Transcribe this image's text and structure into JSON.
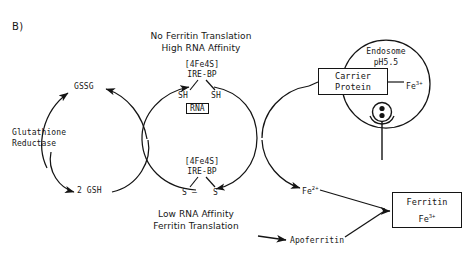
{
  "figure": {
    "panel_label": "B)",
    "title_line1": "No Ferritin Translation",
    "title_line2": "High RNA Affinity",
    "caption_line1": "Low RNA Affinity",
    "caption_line2": "Ferritin Translation"
  },
  "glutathione_cycle": {
    "enzyme_line1": "Glutathione",
    "enzyme_line2": "Reductase",
    "oxidized_label": "GSSG",
    "reduced_label": "2 GSH"
  },
  "irebp_cycle": {
    "top_cluster": "[4Fe4S]",
    "top_protein": "IRE-BP",
    "top_thiol_left": "SH",
    "top_thiol_right": "SH",
    "rna_box": "RNA",
    "bottom_cluster": "[4Fe4S]",
    "bottom_protein": "IRE-BP",
    "disulfide_left": "S",
    "disulfide_bond": "—",
    "disulfide_right": "S"
  },
  "endosome": {
    "name": "Endosome",
    "ph": "pH5.5",
    "carrier_line1": "Carrier",
    "carrier_line2": "Protein",
    "iron_symbol": "Fe",
    "iron_charge": "3+"
  },
  "ferritin_pathway": {
    "ferrous_symbol": "Fe",
    "ferrous_charge": "2+",
    "apoferritin": "Apoferritin",
    "ferritin_box_line1": "Ferritin",
    "ferritin_box_symbol": "Fe",
    "ferritin_box_charge": "3+"
  },
  "style": {
    "ink": "#141414",
    "paper": "#ffffff"
  }
}
